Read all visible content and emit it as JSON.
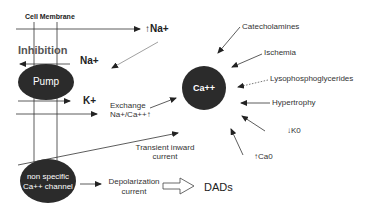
{
  "diagram": {
    "title": "Cell Membrane",
    "inhibition_label": "Inhibition",
    "na_out_label": "Na+",
    "na_rise_label": "↑Na+",
    "k_label": "K+",
    "pump_label": "Pump",
    "ca_label": "Ca++",
    "exchange": {
      "line1": "Exchange",
      "line2": "Na+/Ca++↑"
    },
    "transient": {
      "line1": "Transient inward",
      "line2": "current"
    },
    "channel": {
      "line1": "non specific",
      "line2": "Ca++ channel"
    },
    "depolarization": {
      "line1": "Depolarization",
      "line2": "current"
    },
    "dads_label": "DADs",
    "factors": [
      {
        "label": "Catecholamines",
        "style": "solid"
      },
      {
        "label": "Ischemia",
        "style": "solid"
      },
      {
        "label": "Lysophosphoglycerides",
        "style": "dotted"
      },
      {
        "label": "Hypertrophy",
        "style": "solid"
      },
      {
        "label": "↓K0",
        "style": "solid"
      },
      {
        "label": "↑Ca0",
        "style": "solid"
      }
    ],
    "colors": {
      "node_fill": "#2b2b2b",
      "line": "#333333",
      "text": "#222222"
    }
  }
}
